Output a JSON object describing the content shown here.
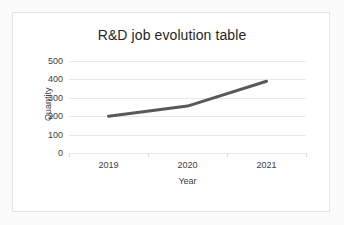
{
  "chart_data": {
    "type": "line",
    "title": "R&D job evolution table",
    "xlabel": "Year",
    "ylabel": "Quantity",
    "categories": [
      "2019",
      "2020",
      "2021"
    ],
    "values": [
      200,
      255,
      390
    ],
    "series": [
      {
        "name": "Quantity",
        "values": [
          200,
          255,
          390
        ],
        "color": "#595959"
      }
    ],
    "ylim": [
      0,
      500
    ],
    "yticks": [
      0,
      100,
      200,
      300,
      400,
      500
    ],
    "ytick_labels": [
      "0",
      "100",
      "200",
      "300",
      "400",
      "500"
    ],
    "grid": "horizontal",
    "legend": "none",
    "line_color": "#595959",
    "line_width": 3,
    "plot_background": "#ffffff",
    "border_color": "#e4e4e4",
    "gridline_color": "#e8e8e8"
  }
}
